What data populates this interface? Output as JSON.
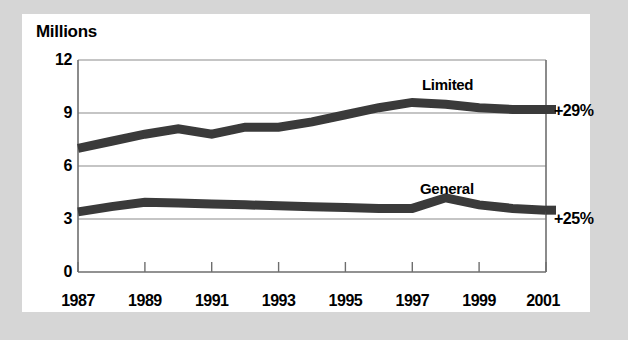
{
  "figure": {
    "background_color": "#d6d6d6",
    "card_color": "#ffffff",
    "line_color": "#3a3a3a",
    "grid_color": "#8c8c8c",
    "axis_color": "#6e6e6e"
  },
  "chart_data": {
    "type": "line",
    "title": "Millions",
    "xlabel": "",
    "ylabel": "Millions",
    "ylim": [
      0,
      12
    ],
    "xlim": [
      1987,
      2001
    ],
    "yticks": [
      "0",
      "3",
      "6",
      "9",
      "12"
    ],
    "ytick_values": [
      0,
      3,
      6,
      9,
      12
    ],
    "xticks": [
      "1987",
      "1989",
      "1991",
      "1993",
      "1995",
      "1997",
      "1999",
      "2001"
    ],
    "xtick_values": [
      1987,
      1989,
      1991,
      1993,
      1995,
      1997,
      1999,
      2001
    ],
    "grid": true,
    "legend": "inline-labels",
    "x": [
      1987,
      1988,
      1989,
      1990,
      1991,
      1992,
      1993,
      1994,
      1995,
      1996,
      1997,
      1998,
      1999,
      2000,
      2001
    ],
    "series": [
      {
        "name": "Limited",
        "label": "Limited",
        "annotation": "+29%",
        "values": [
          7.0,
          7.4,
          7.8,
          8.1,
          7.8,
          8.2,
          8.2,
          8.5,
          8.9,
          9.3,
          9.6,
          9.5,
          9.3,
          9.2,
          9.2
        ]
      },
      {
        "name": "General",
        "label": "General",
        "annotation": "+25%",
        "values": [
          3.4,
          3.7,
          3.95,
          3.9,
          3.85,
          3.8,
          3.75,
          3.7,
          3.65,
          3.6,
          3.6,
          4.2,
          3.8,
          3.6,
          3.5
        ]
      }
    ]
  },
  "labels": {
    "title": "Millions",
    "series_limited": "Limited",
    "series_general": "General",
    "pct_limited": "+29%",
    "pct_general": "+25%",
    "y0": "0",
    "y3": "3",
    "y6": "6",
    "y9": "9",
    "y12": "12",
    "x1987": "1987",
    "x1989": "1989",
    "x1991": "1991",
    "x1993": "1993",
    "x1995": "1995",
    "x1997": "1997",
    "x1999": "1999",
    "x2001": "2001"
  }
}
